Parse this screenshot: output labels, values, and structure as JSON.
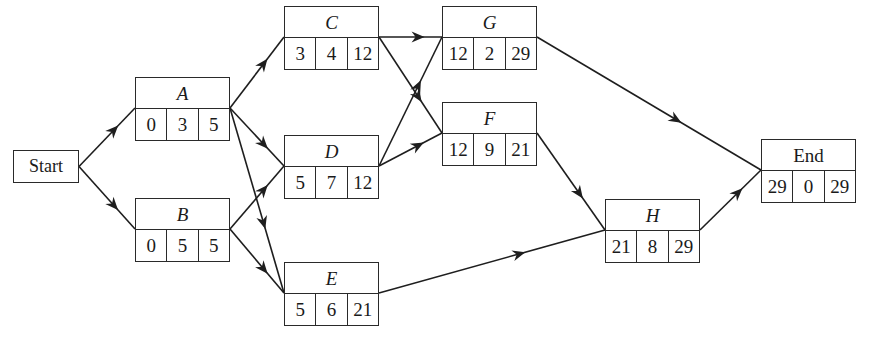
{
  "diagram": {
    "type": "activity-on-node network",
    "start": {
      "label": "Start",
      "x": 13,
      "y": 150,
      "w": 66,
      "h": 33
    },
    "nodes": [
      {
        "id": "A",
        "label": "A",
        "italic": true,
        "x": 135,
        "y": 77,
        "values": [
          "0",
          "3",
          "5"
        ]
      },
      {
        "id": "B",
        "label": "B",
        "italic": true,
        "x": 135,
        "y": 198,
        "values": [
          "0",
          "5",
          "5"
        ]
      },
      {
        "id": "C",
        "label": "C",
        "italic": true,
        "x": 284,
        "y": 6,
        "values": [
          "3",
          "4",
          "12"
        ]
      },
      {
        "id": "D",
        "label": "D",
        "italic": true,
        "x": 284,
        "y": 135,
        "values": [
          "5",
          "7",
          "12"
        ]
      },
      {
        "id": "E",
        "label": "E",
        "italic": true,
        "x": 284,
        "y": 262,
        "values": [
          "5",
          "6",
          "21"
        ]
      },
      {
        "id": "G",
        "label": "G",
        "italic": true,
        "x": 442,
        "y": 6,
        "values": [
          "12",
          "2",
          "29"
        ]
      },
      {
        "id": "F",
        "label": "F",
        "italic": true,
        "x": 442,
        "y": 102,
        "values": [
          "12",
          "9",
          "21"
        ]
      },
      {
        "id": "H",
        "label": "H",
        "italic": true,
        "x": 605,
        "y": 199,
        "values": [
          "21",
          "8",
          "29"
        ]
      },
      {
        "id": "End",
        "label": "End",
        "italic": false,
        "x": 761,
        "y": 139,
        "values": [
          "29",
          "0",
          "29"
        ]
      }
    ],
    "edges": [
      [
        "Start",
        "A"
      ],
      [
        "Start",
        "B"
      ],
      [
        "A",
        "C"
      ],
      [
        "A",
        "D"
      ],
      [
        "A",
        "E"
      ],
      [
        "B",
        "D"
      ],
      [
        "B",
        "E"
      ],
      [
        "C",
        "G"
      ],
      [
        "C",
        "F"
      ],
      [
        "D",
        "G"
      ],
      [
        "D",
        "F"
      ],
      [
        "E",
        "H"
      ],
      [
        "G",
        "End"
      ],
      [
        "F",
        "H"
      ],
      [
        "H",
        "End"
      ]
    ],
    "node_size": {
      "w": 95,
      "h": 64
    }
  }
}
